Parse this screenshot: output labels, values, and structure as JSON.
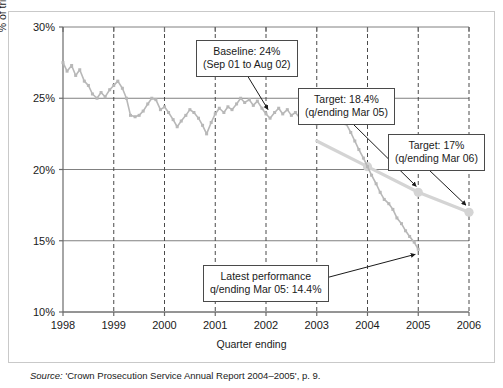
{
  "chart_data": {
    "type": "line",
    "title": "",
    "xlabel": "Quarter ending",
    "ylabel": "% of trials that are ineffective",
    "xlim": [
      1998,
      2006
    ],
    "ylim": [
      10,
      30
    ],
    "ytick_labels": [
      "30%",
      "25%",
      "20%",
      "15%",
      "10%"
    ],
    "ytick_values": [
      30,
      25,
      20,
      15,
      10
    ],
    "xtick_labels": [
      "1998",
      "1999",
      "2000",
      "2001",
      "2002",
      "2003",
      "2004",
      "2005",
      "2006"
    ],
    "xtick_values": [
      1998,
      1999,
      2000,
      2001,
      2002,
      2003,
      2004,
      2005,
      2006
    ],
    "grid": "horizontal solid, vertical dashed at each year",
    "legend": "none",
    "series": [
      {
        "name": "Actual % of ineffective trials",
        "color": "#b8b8b8",
        "x": [
          1998.0,
          1998.08,
          1998.17,
          1998.25,
          1998.33,
          1998.42,
          1998.5,
          1998.58,
          1998.67,
          1998.75,
          1998.83,
          1998.92,
          1999.0,
          1999.08,
          1999.17,
          1999.25,
          1999.33,
          1999.42,
          1999.5,
          1999.58,
          1999.67,
          1999.75,
          1999.83,
          1999.92,
          2000.0,
          2000.08,
          2000.17,
          2000.25,
          2000.33,
          2000.42,
          2000.5,
          2000.58,
          2000.67,
          2000.75,
          2000.83,
          2000.92,
          2001.0,
          2001.08,
          2001.17,
          2001.25,
          2001.33,
          2001.42,
          2001.5,
          2001.58,
          2001.67,
          2001.75,
          2001.83,
          2001.92,
          2002.0,
          2002.08,
          2002.17,
          2002.25,
          2002.33,
          2002.42,
          2002.5,
          2002.58,
          2002.67,
          2002.75,
          2002.83,
          2002.92,
          2003.0,
          2003.08,
          2003.17,
          2003.25,
          2003.33,
          2003.42,
          2003.5,
          2003.58,
          2003.67,
          2003.75,
          2003.83,
          2003.92,
          2004.0,
          2004.08,
          2004.17,
          2004.25,
          2004.33,
          2004.42,
          2004.5,
          2004.58,
          2004.67,
          2004.75,
          2004.83,
          2004.92,
          2005.0
        ],
        "y": [
          27.5,
          26.9,
          27.3,
          26.6,
          27.0,
          26.2,
          25.9,
          25.3,
          25.0,
          25.4,
          25.1,
          25.6,
          25.9,
          26.2,
          25.7,
          25.0,
          23.8,
          23.7,
          23.8,
          24.1,
          24.6,
          25.0,
          24.9,
          24.2,
          24.4,
          24.0,
          23.5,
          23.0,
          23.4,
          23.8,
          24.2,
          24.0,
          23.6,
          23.1,
          22.5,
          23.3,
          23.9,
          24.3,
          24.0,
          24.4,
          24.2,
          24.6,
          25.0,
          24.7,
          24.9,
          24.5,
          24.8,
          24.3,
          23.9,
          23.6,
          24.0,
          24.3,
          23.9,
          24.2,
          23.8,
          24.0,
          23.6,
          23.4,
          23.8,
          23.5,
          23.2,
          23.6,
          24.0,
          24.3,
          23.9,
          24.1,
          23.7,
          23.2,
          22.6,
          22.0,
          21.4,
          20.8,
          20.2,
          19.6,
          19.0,
          18.4,
          17.9,
          17.6,
          17.2,
          16.6,
          16.2,
          15.7,
          15.3,
          14.9,
          14.4
        ]
      },
      {
        "name": "Target trajectory",
        "color": "#d4d4d4",
        "x": [
          2003.0,
          2004.0,
          2005.0,
          2006.0
        ],
        "y": [
          22.0,
          20.2,
          18.4,
          17.0
        ]
      }
    ],
    "annotations": [
      {
        "name": "baseline",
        "line1": "Baseline: 24%",
        "line2": "(Sep 01 to Aug 02)",
        "points_to_x": 2002.0,
        "points_to_y": 24.0
      },
      {
        "name": "target-mar-05",
        "line1": "Target: 18.4%",
        "line2": "(q/ending Mar 05)",
        "points_to_x": 2005.0,
        "points_to_y": 18.4
      },
      {
        "name": "target-mar-06",
        "line1": "Target: 17%",
        "line2": "(q/ending Mar 06)",
        "points_to_x": 2006.0,
        "points_to_y": 17.0
      },
      {
        "name": "latest-performance",
        "line1": "Latest performance",
        "line2": "q/ending Mar 05: 14.4%",
        "points_to_x": 2005.0,
        "points_to_y": 14.4
      }
    ]
  },
  "axes": {
    "y_title": "% of trials that are ineffective",
    "x_title": "Quarter ending"
  },
  "callouts": {
    "baseline": {
      "line1": "Baseline: 24%",
      "line2": "(Sep 01 to Aug 02)"
    },
    "target05": {
      "line1": "Target: 18.4%",
      "line2": "(q/ending Mar 05)"
    },
    "target06": {
      "line1": "Target: 17%",
      "line2": "(q/ending Mar 06)"
    },
    "latest": {
      "line1": "Latest performance",
      "line2": "q/ending Mar 05: 14.4%"
    }
  },
  "source": {
    "prefix": "Source:",
    "text": "'Crown Prosecution Service Annual Report 2004–2005', p. 9."
  },
  "colors": {
    "actual_line": "#b8b8b8",
    "target_line": "#d4d4d4",
    "grid_solid": "#808080",
    "grid_dashed": "#4a4a4a",
    "axis": "#6b6b6b",
    "card_border": "#c9c9c9"
  }
}
